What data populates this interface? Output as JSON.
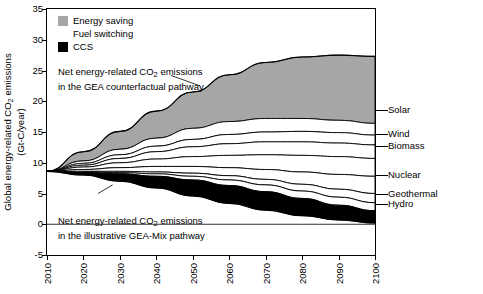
{
  "chart_data": {
    "type": "area",
    "title": "",
    "xlabel": "",
    "ylabel_line1": "Global energy-related CO2 emissions",
    "ylabel_line2": "(Gt-C/year)",
    "ylim": [
      -5,
      35
    ],
    "xlim": [
      2010,
      2100
    ],
    "yticks": [
      "-5",
      "0",
      "5",
      "10",
      "15",
      "20",
      "25",
      "30",
      "35"
    ],
    "xticks": [
      "2010",
      "2020",
      "2030",
      "2040",
      "2050",
      "2060",
      "2070",
      "2080",
      "2090",
      "2100"
    ],
    "grid": false,
    "legend_position": "top-left",
    "legend": [
      {
        "label": "Energy saving",
        "color": "#a6a6a6"
      },
      {
        "label": "Fuel switching",
        "color": "#ffffff"
      },
      {
        "label": "CCS",
        "color": "#000000"
      }
    ],
    "annotations": [
      {
        "id": "counterfactual",
        "line1": "Net energy-related CO2 emissions",
        "line2": "in the GEA counterfactual pathway"
      },
      {
        "id": "gea-mix",
        "line1": "Net energy-related CO2 emissions",
        "line2": "in the illustrative GEA-Mix pathway"
      }
    ],
    "right_labels": [
      {
        "label": "Solar",
        "y": 18.6
      },
      {
        "label": "Wind",
        "y": 14.6
      },
      {
        "label": "Biomass",
        "y": 12.8
      },
      {
        "label": "Nuclear",
        "y": 8.0
      },
      {
        "label": "Geothermal",
        "y": 5.0
      },
      {
        "label": "Hydro",
        "y": 3.3
      }
    ],
    "x": [
      2010,
      2020,
      2030,
      2040,
      2050,
      2060,
      2070,
      2080,
      2090,
      2100
    ],
    "series": [
      {
        "name": "counterfactual_total",
        "values": [
          8.6,
          11.8,
          15.1,
          18.4,
          21.5,
          24.3,
          26.3,
          27.2,
          27.5,
          27.3
        ]
      },
      {
        "name": "energy_saving_lower",
        "values": [
          8.6,
          10.3,
          12.2,
          14.0,
          15.6,
          16.7,
          17.2,
          17.2,
          16.9,
          16.4
        ]
      },
      {
        "name": "solar_lower",
        "values": [
          8.6,
          9.9,
          11.3,
          12.7,
          13.8,
          14.6,
          15.0,
          15.1,
          14.9,
          14.5
        ]
      },
      {
        "name": "wind_lower",
        "values": [
          8.6,
          9.6,
          10.7,
          11.8,
          12.6,
          13.1,
          13.4,
          13.4,
          13.2,
          12.9
        ]
      },
      {
        "name": "biomass_lower",
        "values": [
          8.6,
          9.3,
          10.0,
          10.6,
          11.0,
          11.2,
          11.3,
          11.2,
          11.0,
          10.7
        ]
      },
      {
        "name": "nuclear_lower",
        "values": [
          8.6,
          8.9,
          9.2,
          9.4,
          9.4,
          9.2,
          8.9,
          8.5,
          8.1,
          7.8
        ]
      },
      {
        "name": "geothermal_lower",
        "values": [
          8.6,
          8.6,
          8.6,
          8.5,
          8.3,
          7.9,
          7.3,
          6.5,
          5.7,
          5.0
        ]
      },
      {
        "name": "hydro_lower",
        "values": [
          8.6,
          8.5,
          8.4,
          8.2,
          7.8,
          7.2,
          6.4,
          5.4,
          4.4,
          3.5
        ]
      },
      {
        "name": "ccs_upper",
        "values": [
          8.6,
          8.4,
          8.2,
          7.8,
          7.2,
          6.3,
          5.3,
          4.2,
          3.1,
          2.2
        ]
      },
      {
        "name": "gea_mix_net",
        "values": [
          8.6,
          8.0,
          7.0,
          5.9,
          4.6,
          3.4,
          2.3,
          1.4,
          0.7,
          0.2
        ]
      }
    ]
  }
}
